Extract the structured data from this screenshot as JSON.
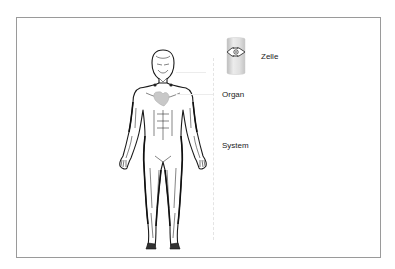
{
  "diagram": {
    "labels": {
      "cell": "Zelle",
      "organ": "Organ",
      "system": "System"
    },
    "icons": {
      "figure": "human-body-figure",
      "cell": "cell-icon",
      "heart": "heart-organ"
    },
    "colors": {
      "frame_border": "#9a9a9a",
      "figure_stroke": "#1a1a1a",
      "organ_fill": "#c8c8c8",
      "cell_fill": "#dcdcdc",
      "text": "#222222"
    }
  }
}
